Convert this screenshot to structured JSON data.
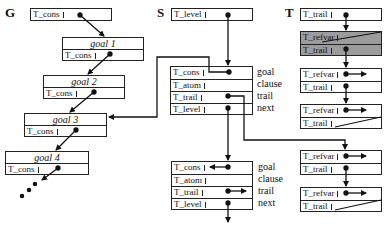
{
  "headers": {
    "g": "G",
    "s": "S",
    "t": "T"
  },
  "g_stack": {
    "root": {
      "field": "T_cons"
    },
    "goals": [
      {
        "title": "goal 1",
        "field": "T_cons"
      },
      {
        "title": "goal 2",
        "field": "T_cons"
      },
      {
        "title": "goal 3",
        "field": "T_cons"
      },
      {
        "title": "goal 4",
        "field": "T_cons"
      }
    ],
    "ellipsis": "..."
  },
  "s_stack": {
    "root": {
      "field": "T_level"
    },
    "frames": [
      {
        "fields": [
          "T_cons",
          "T_atom",
          "T_trail",
          "T_level"
        ]
      },
      {
        "fields": [
          "T_cons",
          "T_atom",
          "T_trail",
          "T_level"
        ]
      }
    ],
    "side_labels": [
      "goal",
      "clause",
      "trail",
      "next"
    ]
  },
  "t_stack": {
    "root": {
      "field": "T_trail"
    },
    "entries": [
      {
        "fields": [
          "T_refvar",
          "T_trail"
        ],
        "shaded": true
      },
      {
        "fields": [
          "T_refvar",
          "T_trail"
        ],
        "shaded": false
      },
      {
        "fields": [
          "T_refvar",
          "T_trail"
        ],
        "shaded": false
      },
      {
        "fields": [
          "T_refvar",
          "T_trail"
        ],
        "shaded": false
      },
      {
        "fields": [
          "T_refvar",
          "T_trail"
        ],
        "shaded": false
      }
    ]
  },
  "colors": {
    "line": "#111111",
    "shade": "#9c9c9c",
    "background": "#ffffff"
  }
}
